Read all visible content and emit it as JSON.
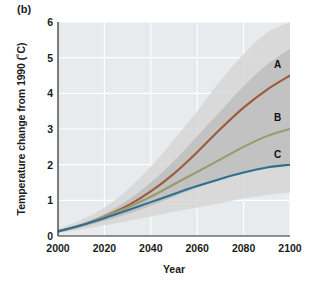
{
  "figure": {
    "panel_label": "(b)",
    "background_color": "#ffffff",
    "plot_background_color": "#e7ebed",
    "gridline_color": "#ffffff"
  },
  "chart_data": {
    "type": "line",
    "title": "",
    "subtitle": "",
    "xlabel": "Year",
    "ylabel": "Temperature change from 1990 (˚C)",
    "xlim": [
      2000,
      2100
    ],
    "ylim": [
      0,
      6
    ],
    "xticks": [
      2000,
      2020,
      2040,
      2060,
      2080,
      2100
    ],
    "xtick_labels": [
      "2000",
      "2020",
      "2040",
      "2060",
      "2080",
      "2100"
    ],
    "yticks": [
      0,
      1,
      2,
      3,
      4,
      5,
      6
    ],
    "ytick_labels": [
      "0",
      "1",
      "2",
      "3",
      "4",
      "5",
      "6"
    ],
    "grid": true,
    "legend_position": "inline-right-end-labels",
    "x": [
      2000,
      2010,
      2020,
      2030,
      2040,
      2050,
      2060,
      2070,
      2080,
      2090,
      2100
    ],
    "series": [
      {
        "name": "A",
        "label": "A",
        "color": "#9c5b3c",
        "values": [
          0.13,
          0.3,
          0.55,
          0.85,
          1.25,
          1.75,
          2.35,
          3.0,
          3.6,
          4.1,
          4.5
        ]
      },
      {
        "name": "B",
        "label": "B",
        "color": "#9a9a6d",
        "values": [
          0.13,
          0.3,
          0.55,
          0.8,
          1.1,
          1.45,
          1.8,
          2.15,
          2.5,
          2.8,
          3.0
        ]
      },
      {
        "name": "C",
        "label": "C",
        "color": "#2f6f8f",
        "values": [
          0.13,
          0.3,
          0.5,
          0.72,
          0.95,
          1.18,
          1.4,
          1.6,
          1.78,
          1.92,
          2.0
        ]
      }
    ],
    "uncertainty_bands": [
      {
        "name": "outer-range",
        "color": "#d6d6d6",
        "upper": [
          0.2,
          0.45,
          0.8,
          1.3,
          1.95,
          2.7,
          3.5,
          4.35,
          5.1,
          5.7,
          6.0
        ],
        "lower": [
          0.08,
          0.18,
          0.3,
          0.42,
          0.55,
          0.68,
          0.8,
          0.92,
          1.05,
          1.15,
          1.22
        ]
      },
      {
        "name": "inner-range",
        "color": "#bdbdbd",
        "upper": [
          0.16,
          0.35,
          0.62,
          1.0,
          1.5,
          2.1,
          2.8,
          3.5,
          4.2,
          4.8,
          5.25
        ],
        "lower": [
          0.1,
          0.24,
          0.42,
          0.62,
          0.85,
          1.1,
          1.35,
          1.58,
          1.78,
          1.93,
          2.02
        ]
      }
    ]
  }
}
